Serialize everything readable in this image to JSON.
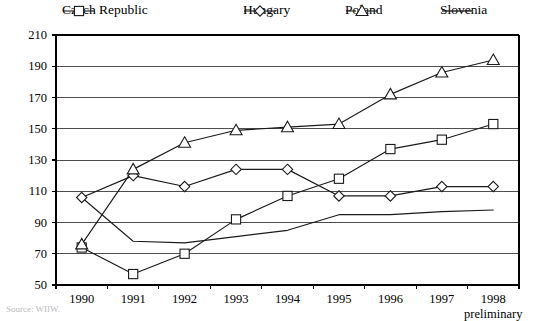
{
  "chart_data": {
    "type": "line",
    "title": "",
    "subtitle": "",
    "xlabel": "",
    "ylabel": "",
    "categories": [
      "1990",
      "1991",
      "1992",
      "1993",
      "1994",
      "1995",
      "1996",
      "1997",
      "1998"
    ],
    "x_note": "preliminary",
    "ylim": [
      50,
      210
    ],
    "y_ticks": [
      50,
      70,
      90,
      110,
      130,
      150,
      170,
      190,
      210
    ],
    "grid": "horizontal",
    "legend_position": "top",
    "series": [
      {
        "name": "Czech Republic",
        "marker": "square",
        "values": [
          74,
          57,
          70,
          92,
          107,
          118,
          137,
          143,
          153
        ]
      },
      {
        "name": "Hungary",
        "marker": "diamond",
        "values": [
          106,
          120,
          113,
          124,
          124,
          107,
          107,
          113,
          113
        ]
      },
      {
        "name": "Poland",
        "marker": "triangle",
        "values": [
          76,
          124,
          141,
          149,
          151,
          153,
          172,
          186,
          194
        ]
      },
      {
        "name": "Slovenia",
        "marker": "none",
        "values": [
          106,
          78,
          77,
          81,
          85,
          95,
          95,
          97,
          98
        ]
      }
    ]
  },
  "source": {
    "text": "Source: WIIW."
  },
  "colors": {
    "line": "#1a1a1a",
    "grid": "#4d4d4d",
    "axis": "#000000",
    "background": "#ffffff"
  }
}
